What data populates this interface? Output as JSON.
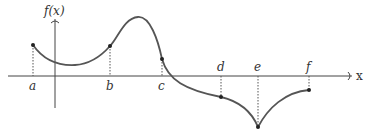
{
  "figure": {
    "y_axis_label": "f(x)",
    "x_axis_label": "x",
    "points": [
      {
        "label": "a",
        "x": 33,
        "y": 45,
        "label_pos": "below"
      },
      {
        "label": "b",
        "x": 110,
        "y": 46,
        "label_pos": "below"
      },
      {
        "label": "c",
        "x": 162,
        "y": 59,
        "label_pos": "below"
      },
      {
        "label": "d",
        "x": 221,
        "y": 97,
        "label_pos": "above"
      },
      {
        "label": "e",
        "x": 258,
        "y": 127,
        "label_pos": "above"
      },
      {
        "label": "f",
        "x": 309,
        "y": 90,
        "label_pos": "above"
      }
    ],
    "colors": {
      "curve": "#555555",
      "axis": "#444444",
      "points": "#222222",
      "background": "#ffffff"
    }
  }
}
